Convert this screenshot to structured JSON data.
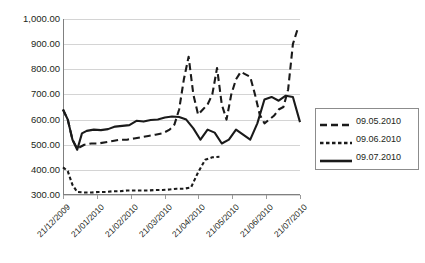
{
  "chart_data": {
    "type": "line",
    "title": "",
    "xlabel": "",
    "ylabel": "",
    "ylim": [
      300,
      1000
    ],
    "ytick_labels": [
      "1,000.00",
      "900.00",
      "800.00",
      "700.00",
      "600.00",
      "500.00",
      "400.00",
      "300.00"
    ],
    "ytick_values": [
      1000,
      900,
      800,
      700,
      600,
      500,
      400,
      300
    ],
    "grid": true,
    "legend_position": "right",
    "categories": [
      "21/12/2009",
      "21/01/2010",
      "21/02/2010",
      "21/03/2010",
      "21/04/2010",
      "21/05/2010",
      "21/06/2010",
      "21/07/2010"
    ],
    "xlim_dates": [
      "21/12/2009",
      "21/07/2010"
    ],
    "series": [
      {
        "name": "09.05.2010",
        "style": "long-dash",
        "color": "#1a1a1a",
        "x": [
          0.0,
          0.02,
          0.04,
          0.06,
          0.09,
          0.12,
          0.15,
          0.18,
          0.21,
          0.24,
          0.27,
          0.3,
          0.33,
          0.36,
          0.39,
          0.42,
          0.45,
          0.47,
          0.49,
          0.51,
          0.53,
          0.55,
          0.57,
          0.59,
          0.61,
          0.63,
          0.65,
          0.67,
          0.69,
          0.71,
          0.73,
          0.75,
          0.77,
          0.79,
          0.81,
          0.83,
          0.85,
          0.87,
          0.89,
          0.91,
          0.93,
          0.95,
          0.97,
          0.99
        ],
        "values": [
          640,
          600,
          520,
          485,
          500,
          505,
          505,
          510,
          515,
          520,
          520,
          525,
          530,
          535,
          540,
          545,
          560,
          580,
          640,
          760,
          850,
          700,
          620,
          640,
          660,
          700,
          805,
          660,
          600,
          700,
          760,
          790,
          780,
          770,
          700,
          620,
          585,
          600,
          615,
          640,
          650,
          720,
          900,
          960
        ]
      },
      {
        "name": "09.06.2010",
        "style": "short-dash",
        "color": "#1a1a1a",
        "x": [
          0.0,
          0.02,
          0.04,
          0.06,
          0.09,
          0.12,
          0.15,
          0.18,
          0.21,
          0.24,
          0.27,
          0.3,
          0.33,
          0.36,
          0.39,
          0.42,
          0.45,
          0.48,
          0.51,
          0.54,
          0.57,
          0.6,
          0.63,
          0.66
        ],
        "values": [
          410,
          395,
          340,
          312,
          310,
          310,
          312,
          312,
          315,
          315,
          318,
          318,
          318,
          318,
          320,
          320,
          322,
          325,
          325,
          330,
          390,
          440,
          450,
          452
        ]
      },
      {
        "name": "09.07.2010",
        "style": "solid",
        "color": "#1a1a1a",
        "x": [
          0.0,
          0.02,
          0.04,
          0.06,
          0.08,
          0.1,
          0.13,
          0.16,
          0.19,
          0.22,
          0.25,
          0.28,
          0.31,
          0.34,
          0.37,
          0.4,
          0.43,
          0.46,
          0.49,
          0.52,
          0.55,
          0.58,
          0.61,
          0.64,
          0.67,
          0.7,
          0.73,
          0.76,
          0.79,
          0.82,
          0.85,
          0.88,
          0.91,
          0.94,
          0.97,
          1.0
        ],
        "values": [
          640,
          600,
          520,
          480,
          545,
          555,
          560,
          558,
          562,
          572,
          575,
          578,
          595,
          592,
          598,
          600,
          608,
          612,
          610,
          600,
          565,
          520,
          560,
          548,
          505,
          520,
          560,
          540,
          520,
          585,
          680,
          690,
          675,
          695,
          690,
          590
        ]
      }
    ]
  },
  "legend": {
    "items": [
      {
        "label": "09.05.2010",
        "style": "long-dash"
      },
      {
        "label": "09.06.2010",
        "style": "short-dash"
      },
      {
        "label": "09.07.2010",
        "style": "solid"
      }
    ]
  }
}
